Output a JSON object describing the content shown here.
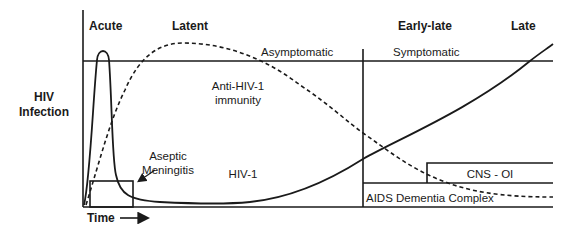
{
  "diagram": {
    "y_axis_label": [
      "HIV",
      "Infection"
    ],
    "x_axis_label": "Time",
    "stages": [
      {
        "label": "Acute"
      },
      {
        "label": "Latent"
      },
      {
        "label": "Early-late"
      },
      {
        "label": "Late"
      }
    ],
    "phases": {
      "asymptomatic": "Asymptomatic",
      "symptomatic": "Symptomatic"
    },
    "curves": {
      "immunity": [
        "Anti-HIV-1",
        "immunity"
      ],
      "hiv": "HIV-1"
    },
    "boxes": {
      "aseptic": [
        "Aseptic",
        "Meningitis"
      ],
      "cns": "CNS - OI",
      "adc": "AIDS Dementia Complex"
    },
    "colors": {
      "line": "#1a1a1a",
      "background": "#ffffff"
    }
  }
}
